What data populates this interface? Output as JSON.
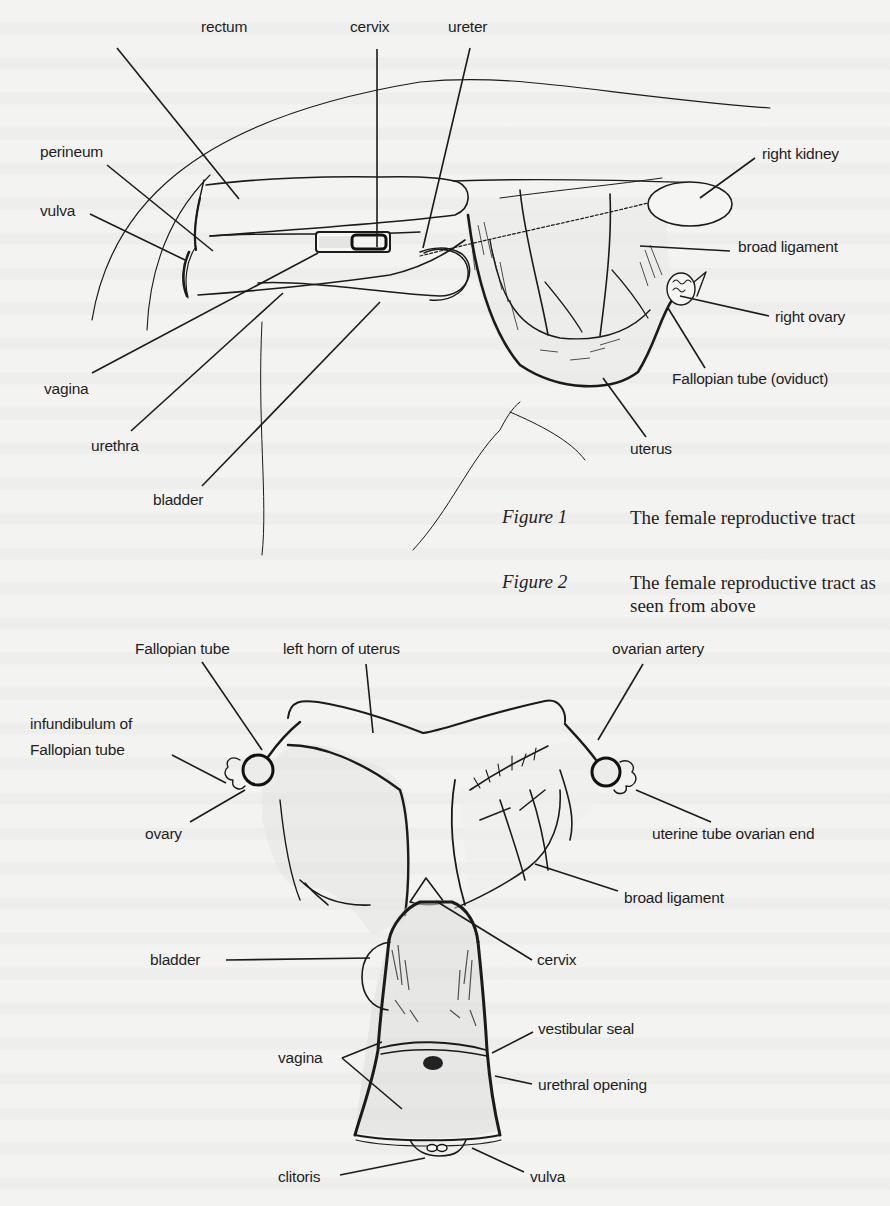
{
  "figure1": {
    "caption_label": "Figure 1",
    "caption_text": "The female reproductive tract",
    "labels": [
      {
        "id": "rectum",
        "text": "rectum",
        "x": 201,
        "y": 26,
        "line": [
          117,
          48,
          239,
          199
        ]
      },
      {
        "id": "cervix",
        "text": "cervix",
        "x": 345,
        "y": 26,
        "line": [
          377,
          49,
          377,
          247
        ]
      },
      {
        "id": "ureter",
        "text": "ureter",
        "x": 448,
        "y": 26,
        "line": [
          470,
          48,
          423,
          248
        ]
      },
      {
        "id": "perineum",
        "text": "perineum",
        "x": 40,
        "y": 141,
        "line": [
          107,
          165,
          213,
          251
        ]
      },
      {
        "id": "vulva",
        "text": "vulva",
        "x": 40,
        "y": 201,
        "line": [
          90,
          214,
          185,
          260
        ]
      },
      {
        "id": "right-kidney",
        "text": "right kidney",
        "x": 762,
        "y": 145,
        "line": [
          755,
          158,
          700,
          198
        ]
      },
      {
        "id": "broad-ligament",
        "text": "broad ligament",
        "x": 735,
        "y": 237,
        "line": [
          730,
          251,
          640,
          246
        ]
      },
      {
        "id": "right-ovary",
        "text": "right ovary",
        "x": 775,
        "y": 309,
        "line": [
          769,
          316,
          680,
          296
        ]
      },
      {
        "id": "fallopian-tube-oviduct",
        "text": "Fallopian tube (oviduct)",
        "x": 672,
        "y": 370,
        "line": [
          705,
          368,
          668,
          308
        ]
      },
      {
        "id": "vagina",
        "text": "vagina",
        "x": 44,
        "y": 380,
        "line": [
          92,
          373,
          318,
          253
        ]
      },
      {
        "id": "urethra",
        "text": "urethra",
        "x": 91,
        "y": 437,
        "line": [
          131,
          431,
          283,
          293
        ]
      },
      {
        "id": "uterus",
        "text": "uterus",
        "x": 630,
        "y": 440,
        "line": [
          646,
          437,
          603,
          378
        ]
      },
      {
        "id": "bladder",
        "text": "bladder",
        "x": 153,
        "y": 491,
        "line": [
          202,
          486,
          380,
          302
        ]
      }
    ]
  },
  "figure2": {
    "caption_label": "Figure 2",
    "caption_text": "The female reproductive tract as seen from above",
    "labels": [
      {
        "id": "fallopian-tube",
        "text": "Fallopian tube",
        "x": 135,
        "y": 638,
        "line": [
          202,
          662,
          262,
          750
        ]
      },
      {
        "id": "left-horn-of-uterus",
        "text": "left horn of uterus",
        "x": 283,
        "y": 638,
        "line": [
          366,
          664,
          373,
          733
        ]
      },
      {
        "id": "ovarian-artery",
        "text": "ovarian artery",
        "x": 610,
        "y": 638,
        "line": [
          643,
          664,
          598,
          740
        ]
      },
      {
        "id": "infundibulum-of-fallopian-tube",
        "text": "infundibulum of Fallopian tube",
        "x": 29,
        "y": 714,
        "line": [
          172,
          755,
          226,
          783
        ]
      },
      {
        "id": "ovary",
        "text": "ovary",
        "x": 145,
        "y": 825,
        "line": [
          190,
          822,
          245,
          790
        ]
      },
      {
        "id": "uterine-tube-ovarian-end",
        "text": "uterine tube ovarian end",
        "x": 647,
        "y": 825,
        "line": [
          711,
          822,
          636,
          790
        ]
      },
      {
        "id": "broad-ligament-2",
        "text": "broad ligament",
        "x": 624,
        "y": 890,
        "line": [
          618,
          891,
          535,
          864
        ]
      },
      {
        "id": "bladder-2",
        "text": "bladder",
        "x": 150,
        "y": 952,
        "line": [
          226,
          960,
          370,
          958
        ]
      },
      {
        "id": "cervix-2",
        "text": "cervix",
        "x": 537,
        "y": 952,
        "line": [
          532,
          960,
          436,
          901
        ]
      },
      {
        "id": "vestibular-seal",
        "text": "vestibular seal",
        "x": 536,
        "y": 1020,
        "line": [
          533,
          1032,
          492,
          1053
        ]
      },
      {
        "id": "vagina-2",
        "text": "vagina",
        "x": 278,
        "y": 1048,
        "line": [
          342,
          1058,
          382,
          1042
        ]
      },
      {
        "id": "urethral-opening",
        "text": "urethral opening",
        "x": 536,
        "y": 1075,
        "line": [
          532,
          1084,
          495,
          1076
        ]
      },
      {
        "id": "clitoris",
        "text": "clitoris",
        "x": 278,
        "y": 1168,
        "line": [
          340,
          1175,
          425,
          1158
        ]
      },
      {
        "id": "vulva-2",
        "text": "vulva",
        "x": 530,
        "y": 1168,
        "line": [
          524,
          1172,
          472,
          1148
        ]
      }
    ],
    "vagina_second_line": [
      342,
      1058,
      402,
      1109
    ]
  }
}
